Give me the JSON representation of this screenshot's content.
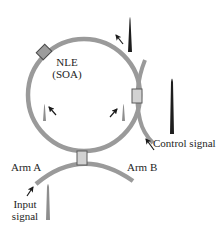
{
  "diagram": {
    "labels": {
      "nle": "NLE",
      "soa": "(SOA)",
      "control_signal": "Control signal",
      "arm_a": "Arm  A",
      "arm_b": "Arm  B",
      "input_line1": "Input",
      "input_line2": "signal"
    },
    "colors": {
      "fiber": "#9a9a9a",
      "coupler_fill": "#d2d2d2",
      "coupler_stroke": "#5a5a5a",
      "nle_fill": "#9c9c9c",
      "pulse_dark": "#1e1e1e",
      "pulse_gray": "#8e8e8e",
      "arrow": "#1a1a1a"
    },
    "components": [
      {
        "id": "loop",
        "type": "fiber-loop"
      },
      {
        "id": "nle",
        "type": "nonlinear-element",
        "label": "NLE (SOA)"
      },
      {
        "id": "control-coupler",
        "type": "coupler"
      },
      {
        "id": "main-coupler",
        "type": "coupler"
      },
      {
        "id": "control-pulse-out",
        "type": "pulse",
        "tone": "dark"
      },
      {
        "id": "control-pulse-in",
        "type": "pulse",
        "tone": "dark"
      },
      {
        "id": "ccw-pulse",
        "type": "pulse",
        "tone": "gray"
      },
      {
        "id": "cw-pulse",
        "type": "pulse",
        "tone": "gray"
      },
      {
        "id": "input-pulse",
        "type": "pulse",
        "tone": "gray"
      }
    ]
  }
}
